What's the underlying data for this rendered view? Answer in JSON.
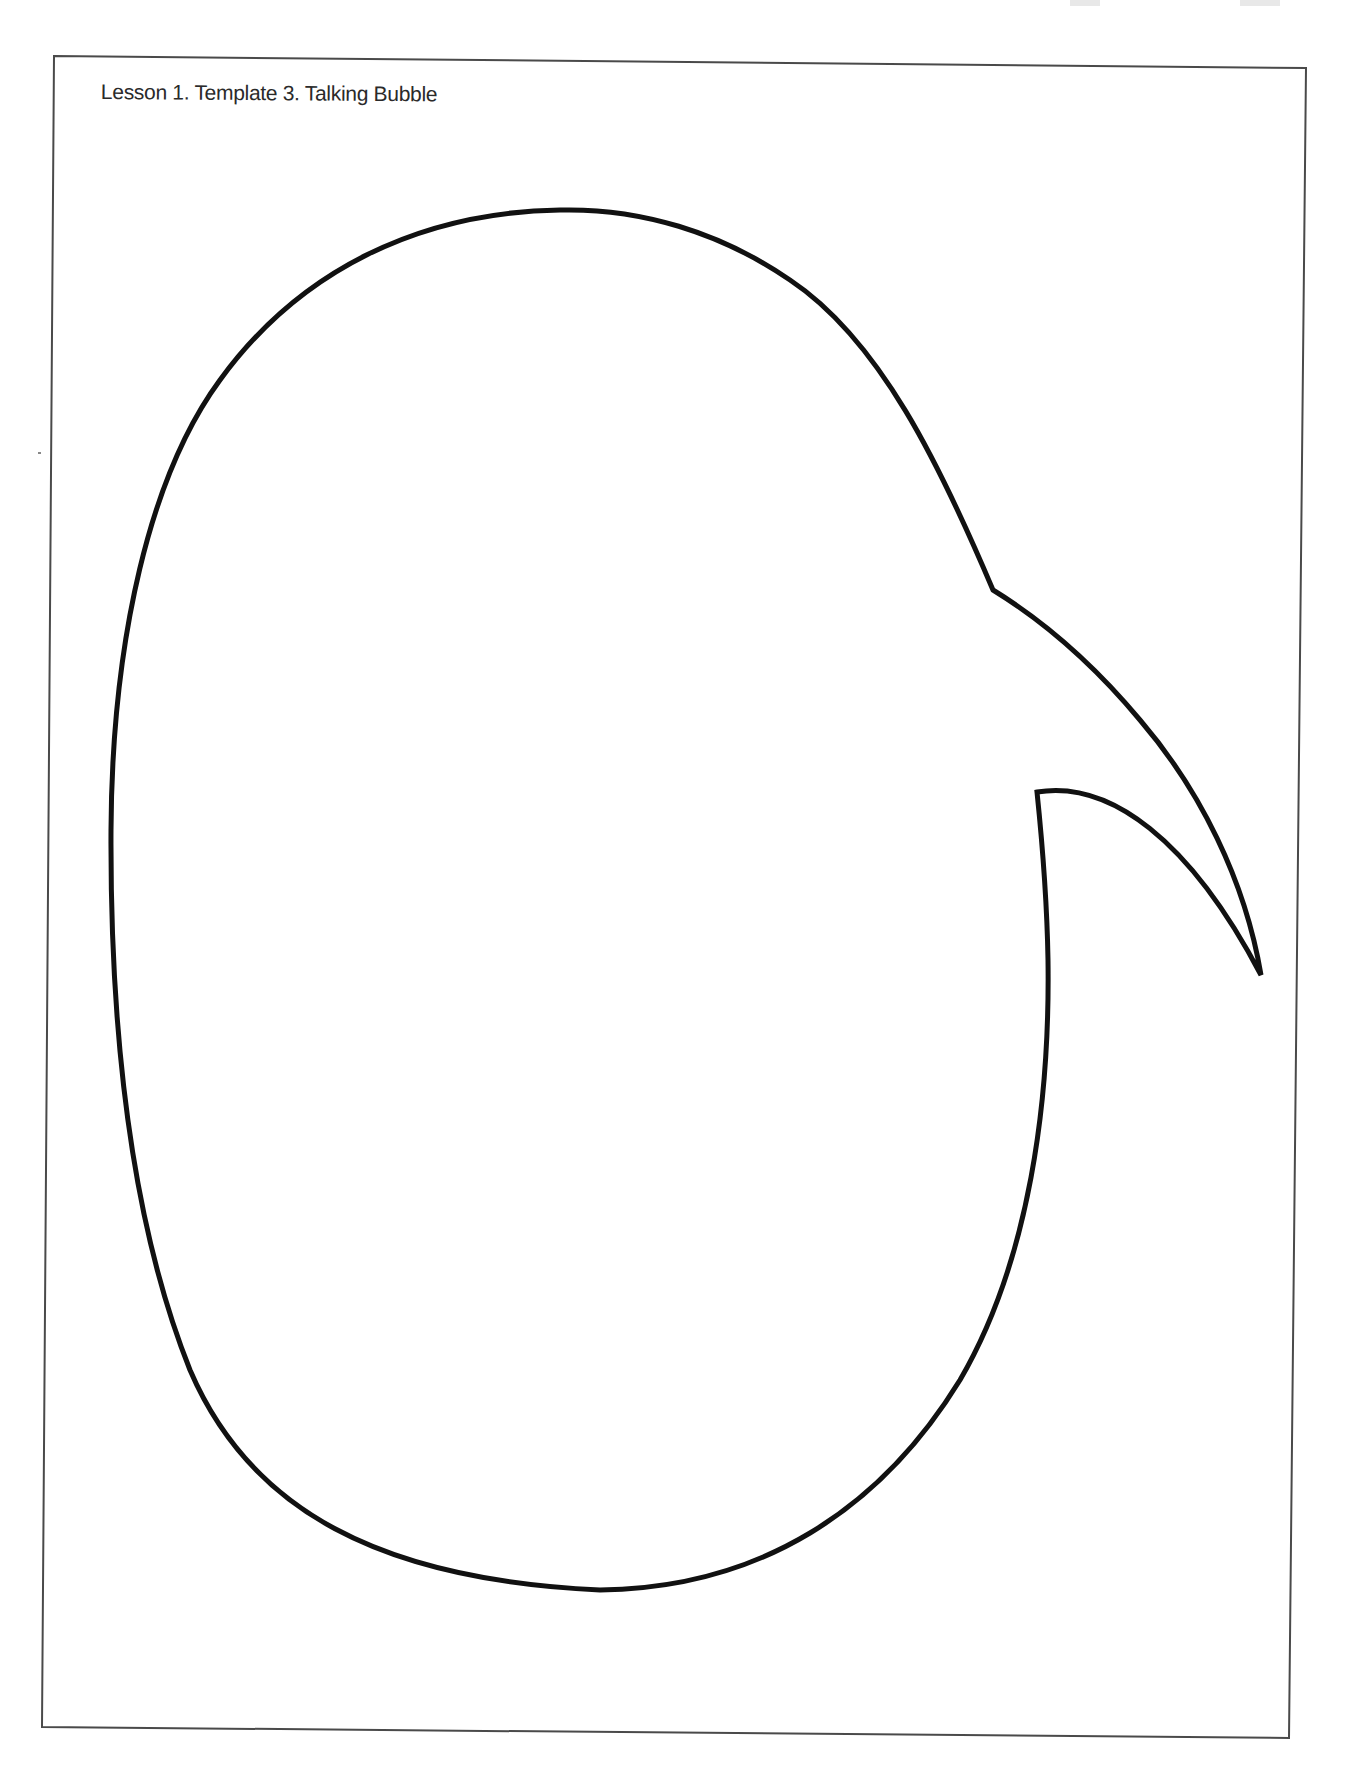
{
  "document": {
    "title": "Lesson 1. Template 3. Talking Bubble",
    "shape": "speech-bubble-outline",
    "colors": {
      "background": "#ffffff",
      "frame": "#4a4a4a",
      "bubble_outline": "#111111",
      "text": "#2a2a2a"
    }
  }
}
